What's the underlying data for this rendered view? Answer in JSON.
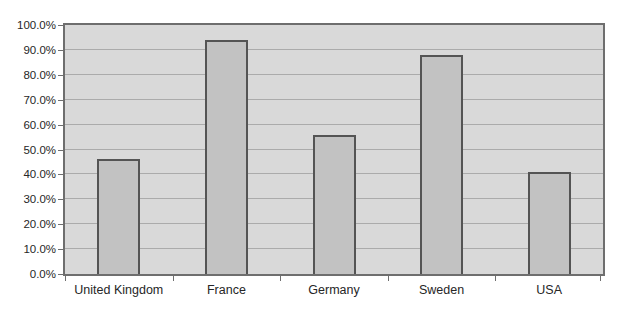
{
  "chart_data": {
    "type": "bar",
    "title": "",
    "xlabel": "",
    "ylabel": "",
    "categories": [
      "United Kingdom",
      "France",
      "Germany",
      "Sweden",
      "USA"
    ],
    "values": [
      46,
      94,
      56,
      88,
      41
    ],
    "ylim": [
      0,
      100
    ],
    "ytick_step": 10,
    "ytick_labels": [
      "0.0%",
      "10.0%",
      "20.0%",
      "30.0%",
      "40.0%",
      "50.0%",
      "60.0%",
      "70.0%",
      "80.0%",
      "90.0%",
      "100.0%"
    ],
    "grid": "horizontal",
    "legend": "none",
    "series_count": 1,
    "colors": {
      "page_bg": "#ffffff",
      "plot_bg": "#d9d9d9",
      "bar_fill": "#c2c2c2",
      "bar_border": "#545454",
      "grid": "#ababab",
      "axis": "#6e6e6e",
      "text": "#262626"
    }
  }
}
